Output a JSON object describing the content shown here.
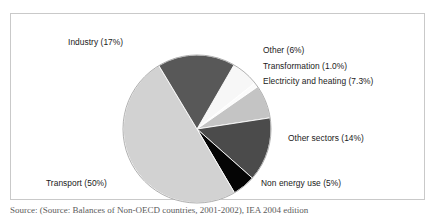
{
  "figure": {
    "source_note": "Source: (Source: Balances of Non-OECD countries, 2001-2002), IEA 2004 edition"
  },
  "chart_data": {
    "type": "pie",
    "title": "",
    "subtitle": "",
    "xlabel": "",
    "ylabel": "",
    "legend_position": "none",
    "grid": false,
    "units": "percent",
    "start_angle_deg": -60,
    "direction": "clockwise",
    "categories": [
      "Other",
      "Transformation",
      "Electricity and heating",
      "Other sectors",
      "Non energy use",
      "Transport",
      "Industry"
    ],
    "values": [
      6,
      1.0,
      7.3,
      14,
      5,
      50,
      17
    ],
    "colors": [
      "#f7f7f7",
      "#fbfbfb",
      "#c4c4c4",
      "#4b4b4b",
      "#050505",
      "#d2d2d2",
      "#585858"
    ],
    "labels": [
      "Other (6%)",
      "Transformation (1.0%)",
      "Electricity and heating (7.3%)",
      "Other sectors (14%)",
      "Non energy use (5%)",
      "Transport (50%)",
      "Industry (17%)"
    ],
    "slices": [
      {
        "name": "Other",
        "value": 6,
        "label": "Other (6%)",
        "color": "#f7f7f7"
      },
      {
        "name": "Transformation",
        "value": 1.0,
        "label": "Transformation (1.0%)",
        "color": "#fbfbfb"
      },
      {
        "name": "Electricity and heating",
        "value": 7.3,
        "label": "Electricity and heating (7.3%)",
        "color": "#c4c4c4"
      },
      {
        "name": "Other sectors",
        "value": 14,
        "label": "Other sectors (14%)",
        "color": "#4b4b4b"
      },
      {
        "name": "Non energy use",
        "value": 5,
        "label": "Non energy use (5%)",
        "color": "#050505"
      },
      {
        "name": "Transport",
        "value": 50,
        "label": "Transport (50%)",
        "color": "#d2d2d2"
      },
      {
        "name": "Industry",
        "value": 17,
        "label": "Industry (17%)",
        "color": "#585858"
      }
    ]
  }
}
